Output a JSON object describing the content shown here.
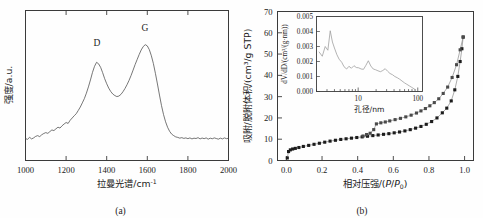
{
  "figure": {
    "panels": [
      {
        "id": "a",
        "caption": "(a)",
        "chart_data": {
          "type": "line",
          "title": "",
          "xlabel": "拉曼光谱/cm⁻¹",
          "ylabel": "强度/a.u.",
          "xlim": [
            1000,
            2000
          ],
          "ylim": [
            0,
            1
          ],
          "xticks": [
            1000,
            1200,
            1400,
            1600,
            1800,
            2000
          ],
          "xticklabels": [
            "1000",
            "1200",
            "1400",
            "1600",
            "1800",
            "2000"
          ],
          "yticks": [],
          "yticklabels": [],
          "grid": false,
          "legend": null,
          "annotations": [
            {
              "text": "D",
              "x": 1352,
              "y": 0.78
            },
            {
              "text": "G",
              "x": 1588,
              "y": 0.9
            }
          ],
          "series": [
            {
              "name": "Raman intensity",
              "color": "#4a4a4a",
              "x": [
                1000,
                1010,
                1020,
                1030,
                1040,
                1050,
                1060,
                1070,
                1080,
                1090,
                1100,
                1110,
                1120,
                1130,
                1140,
                1150,
                1160,
                1170,
                1180,
                1190,
                1200,
                1210,
                1220,
                1230,
                1240,
                1250,
                1260,
                1270,
                1280,
                1290,
                1300,
                1310,
                1320,
                1330,
                1340,
                1350,
                1360,
                1370,
                1380,
                1390,
                1400,
                1410,
                1420,
                1430,
                1440,
                1450,
                1460,
                1470,
                1480,
                1490,
                1500,
                1510,
                1520,
                1530,
                1540,
                1550,
                1560,
                1570,
                1580,
                1590,
                1600,
                1610,
                1620,
                1630,
                1640,
                1650,
                1660,
                1670,
                1680,
                1690,
                1700,
                1710,
                1720,
                1730,
                1740,
                1750,
                1760,
                1770,
                1780,
                1790,
                1800,
                1810,
                1820,
                1830,
                1840,
                1850,
                1860,
                1870,
                1880,
                1890,
                1900,
                1910,
                1920,
                1930,
                1940,
                1950,
                1960,
                1970,
                1980,
                1990,
                2000
              ],
              "y": [
                0.095,
                0.088,
                0.105,
                0.092,
                0.1,
                0.112,
                0.118,
                0.11,
                0.125,
                0.135,
                0.142,
                0.136,
                0.15,
                0.163,
                0.158,
                0.172,
                0.185,
                0.178,
                0.196,
                0.21,
                0.222,
                0.215,
                0.24,
                0.258,
                0.276,
                0.292,
                0.318,
                0.345,
                0.378,
                0.412,
                0.455,
                0.505,
                0.56,
                0.62,
                0.668,
                0.7,
                0.688,
                0.66,
                0.618,
                0.57,
                0.53,
                0.495,
                0.468,
                0.448,
                0.436,
                0.428,
                0.432,
                0.445,
                0.466,
                0.492,
                0.522,
                0.556,
                0.595,
                0.638,
                0.682,
                0.722,
                0.762,
                0.798,
                0.825,
                0.84,
                0.83,
                0.8,
                0.752,
                0.69,
                0.612,
                0.528,
                0.44,
                0.356,
                0.285,
                0.228,
                0.184,
                0.152,
                0.13,
                0.118,
                0.108,
                0.104,
                0.098,
                0.102,
                0.096,
                0.1,
                0.094,
                0.1,
                0.092,
                0.098,
                0.095,
                0.102,
                0.092,
                0.099,
                0.094,
                0.1,
                0.09,
                0.098,
                0.093,
                0.1,
                0.095,
                0.09,
                0.098,
                0.092,
                0.1,
                0.094,
                0.097
              ]
            }
          ]
        }
      },
      {
        "id": "b",
        "caption": "(b)",
        "chart_data": {
          "type": "line",
          "title": "",
          "xlabel": "相对压强/(P/P₀)",
          "ylabel": "吸附/脱附体积/(cm³/g STP)",
          "xlim": [
            -0.05,
            1.05
          ],
          "ylim": [
            0,
            70
          ],
          "xticks": [
            0.0,
            0.2,
            0.4,
            0.6,
            0.8,
            1.0
          ],
          "xticklabels": [
            "0.0",
            "0.2",
            "0.4",
            "0.6",
            "0.8",
            "1.0"
          ],
          "yticks": [
            0,
            10,
            20,
            30,
            40,
            50,
            60,
            70
          ],
          "yticklabels": [
            "0",
            "10",
            "20",
            "30",
            "40",
            "50",
            "60",
            "70"
          ],
          "grid": false,
          "legend": null,
          "series": [
            {
              "name": "吸附 (adsorption)",
              "marker": "filled-square",
              "color": "#1c1c1c",
              "x": [
                0.005,
                0.012,
                0.022,
                0.035,
                0.05,
                0.07,
                0.095,
                0.125,
                0.155,
                0.185,
                0.215,
                0.245,
                0.275,
                0.305,
                0.335,
                0.365,
                0.395,
                0.425,
                0.455,
                0.485,
                0.515,
                0.545,
                0.575,
                0.605,
                0.635,
                0.665,
                0.695,
                0.725,
                0.755,
                0.785,
                0.815,
                0.845,
                0.875,
                0.9,
                0.925,
                0.945,
                0.962,
                0.975,
                0.985,
                0.992
              ],
              "y": [
                1.2,
                4.2,
                5.0,
                5.4,
                5.7,
                6.1,
                6.6,
                7.1,
                7.6,
                8.1,
                8.6,
                9.1,
                9.5,
                9.9,
                10.2,
                10.5,
                10.8,
                11.1,
                11.4,
                11.7,
                12.0,
                12.3,
                12.6,
                13.0,
                13.4,
                13.9,
                14.5,
                15.2,
                16.0,
                17.0,
                18.3,
                20.0,
                22.4,
                24.6,
                28.0,
                33.2,
                39.5,
                46.5,
                52.5,
                58.0
              ]
            },
            {
              "name": "脱附 (desorption)",
              "marker": "filled-square",
              "color": "#4a4a4a",
              "x": [
                0.992,
                0.975,
                0.955,
                0.93,
                0.905,
                0.88,
                0.855,
                0.83,
                0.805,
                0.78,
                0.755,
                0.73,
                0.7,
                0.67,
                0.64,
                0.61,
                0.58,
                0.555,
                0.53,
                0.505,
                0.49,
                0.47,
                0.45,
                0.43
              ],
              "y": [
                58.0,
                52.0,
                45.0,
                39.0,
                34.5,
                31.5,
                29.0,
                27.2,
                25.7,
                24.4,
                23.3,
                22.3,
                21.3,
                20.5,
                19.8,
                19.2,
                18.6,
                18.1,
                17.7,
                17.2,
                14.5,
                12.8,
                12.2,
                11.5
              ]
            }
          ],
          "inset": {
            "type": "line",
            "xlabel": "孔径/nm",
            "ylabel": "dV/dD/(cm³/(g·nm))",
            "xscale": "log",
            "xlim": [
              2,
              120
            ],
            "ylim": [
              0.0,
              0.005
            ],
            "xticks": [
              10,
              100
            ],
            "xticklabels": [
              "10",
              "100"
            ],
            "yticks": [
              0.0,
              0.001,
              0.002,
              0.003,
              0.004,
              0.005
            ],
            "yticklabels": [
              "0.000",
              "0.001",
              "0.002",
              "0.003",
              "0.004",
              "0.005"
            ],
            "grid": false,
            "series": [
              {
                "name": "pore size distribution",
                "color": "#9a9a9a",
                "x": [
                  2.2,
                  2.5,
                  2.8,
                  3.1,
                  3.4,
                  3.7,
                  4.0,
                  4.4,
                  4.8,
                  5.3,
                  5.8,
                  6.4,
                  7.0,
                  7.7,
                  8.5,
                  9.3,
                  10.2,
                  11.2,
                  12.3,
                  13.5,
                  14.8,
                  16.3,
                  17.9,
                  19.6,
                  21.5,
                  23.6,
                  25.9,
                  28.4,
                  31.2,
                  34.2,
                  37.6,
                  41.2,
                  45.2,
                  49.6,
                  54.4,
                  59.7,
                  65.5,
                  71.9,
                  78.9,
                  86.6,
                  92.0
                ],
                "y": [
                  0.00265,
                  0.00235,
                  0.003,
                  0.00275,
                  0.00405,
                  0.0033,
                  0.0029,
                  0.00245,
                  0.00215,
                  0.00195,
                  0.00165,
                  0.0015,
                  0.00168,
                  0.00155,
                  0.00172,
                  0.0016,
                  0.00158,
                  0.0015,
                  0.00148,
                  0.00175,
                  0.00205,
                  0.0017,
                  0.0015,
                  0.00145,
                  0.00138,
                  0.00132,
                  0.0014,
                  0.00152,
                  0.00135,
                  0.0012,
                  0.00112,
                  0.001,
                  0.00092,
                  0.00082,
                  0.0007,
                  0.00058,
                  0.00048,
                  0.00038,
                  0.00028,
                  0.00018,
                  0.0001
                ]
              }
            ]
          }
        }
      }
    ]
  }
}
